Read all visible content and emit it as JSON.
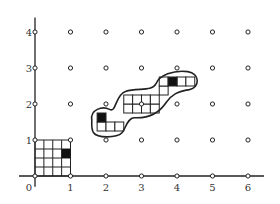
{
  "diagram": {
    "origin_px": [
      35,
      176
    ],
    "unit_x_px": 35.5,
    "unit_y_px": 36,
    "x_axis": {
      "ticks": [
        "0",
        "1",
        "2",
        "3",
        "4",
        "5",
        "6"
      ],
      "range": [
        0,
        6
      ]
    },
    "y_axis": {
      "ticks": [
        "1",
        "2",
        "3",
        "4"
      ],
      "range": [
        0,
        4
      ]
    },
    "lattice_points": "integer points (x 0..6, y 0..4) shown as small open circles",
    "unit_square": {
      "from": [
        0,
        0
      ],
      "to": [
        1,
        1
      ],
      "subdivisions": 4,
      "black_cell": {
        "col": 3,
        "row_from_top": 1
      }
    },
    "blob": {
      "description": "Polyomino of quarter-unit cells enclosed by a smooth closed curve",
      "cell_size": 0.25,
      "white_cells": [
        [
          1.75,
          1.25
        ],
        [
          2.0,
          1.25
        ],
        [
          2.25,
          1.25
        ],
        [
          2.5,
          1.75
        ],
        [
          2.75,
          1.75
        ],
        [
          3.0,
          1.75
        ],
        [
          3.25,
          1.75
        ],
        [
          2.5,
          2.0
        ],
        [
          2.75,
          2.0
        ],
        [
          3.0,
          2.0
        ],
        [
          3.25,
          2.0
        ],
        [
          3.5,
          2.25
        ],
        [
          3.5,
          2.5
        ],
        [
          4.0,
          2.5
        ],
        [
          4.25,
          2.5
        ]
      ],
      "black_cells": [
        [
          1.75,
          1.5
        ],
        [
          3.75,
          2.5
        ]
      ]
    },
    "colors": {
      "ink": "#222222",
      "fill": "#111111",
      "bg": "#ffffff"
    }
  }
}
